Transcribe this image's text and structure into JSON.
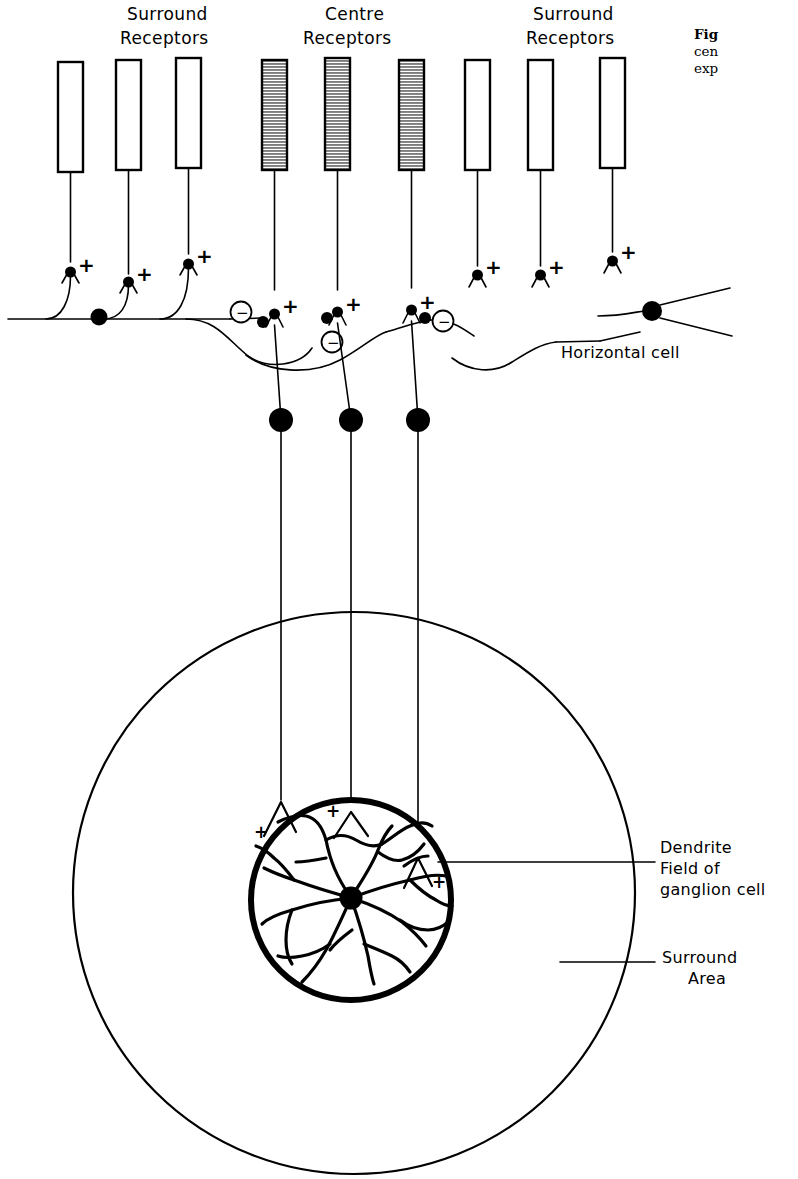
{
  "figure": {
    "domain": "Diagram",
    "background_color": "#ffffff",
    "ink_color": "#000000",
    "centre_bar_fill": "#9a9a9a",
    "surround_bar_fill": "#ffffff",
    "width": 798,
    "height": 1179
  },
  "top_labels": [
    {
      "id": "surround-left",
      "line1": "Surround",
      "line2": "Receptors",
      "x": 127,
      "y": 18
    },
    {
      "id": "centre",
      "line1": "Centre",
      "line2": "Receptors",
      "x": 318,
      "y": 18
    },
    {
      "id": "surround-right",
      "line1": "Surround",
      "line2": "Receptors",
      "x": 530,
      "y": 18
    }
  ],
  "receptors": [
    {
      "id": "surround-receptor-1",
      "group": "surround",
      "x": 58,
      "fill": "#ffffff"
    },
    {
      "id": "surround-receptor-2",
      "group": "surround",
      "x": 116,
      "fill": "#ffffff"
    },
    {
      "id": "surround-receptor-3",
      "group": "surround",
      "x": 176,
      "fill": "#ffffff"
    },
    {
      "id": "centre-receptor-1",
      "group": "centre",
      "x": 262,
      "fill": "#9a9a9a"
    },
    {
      "id": "centre-receptor-2",
      "group": "centre",
      "x": 325,
      "fill": "#9a9a9a"
    },
    {
      "id": "centre-receptor-3",
      "group": "centre",
      "x": 399,
      "fill": "#9a9a9a"
    },
    {
      "id": "surround-receptor-4",
      "group": "surround",
      "x": 465,
      "fill": "#ffffff"
    },
    {
      "id": "surround-receptor-5",
      "group": "surround",
      "x": 528,
      "fill": "#ffffff"
    },
    {
      "id": "surround-receptor-6",
      "group": "surround",
      "x": 600,
      "fill": "#ffffff"
    }
  ],
  "synapse_signs": {
    "excitatory": "+",
    "inhibitory": "−",
    "excitatory_count": 12,
    "inhibitory_count": 3
  },
  "inline_labels": [
    {
      "id": "horizontal-cell-label",
      "text": "Horizontal cell",
      "x": 560,
      "y": 352
    },
    {
      "id": "dendrite-field-label-line1",
      "text": "Dendrite",
      "x": 660,
      "y": 847
    },
    {
      "id": "dendrite-field-label-line2",
      "text": "Field of",
      "x": 660,
      "y": 868
    },
    {
      "id": "dendrite-field-label-line3",
      "text": "ganglion cell",
      "x": 660,
      "y": 889
    },
    {
      "id": "surround-area-label-line1",
      "text": "Surround",
      "x": 663,
      "y": 958
    },
    {
      "id": "surround-area-label-line2",
      "text": "Area",
      "x": 688,
      "y": 979
    }
  ],
  "caption": {
    "lines": [
      {
        "text": "Fig",
        "bold": true
      },
      {
        "text": "cen",
        "bold": false
      },
      {
        "text": "exp",
        "bold": false
      }
    ],
    "note": "caption is clipped at the right page margin"
  },
  "geometry": {
    "bar_top": 58,
    "bar_height": 112,
    "bar_width": 25,
    "horizontal_cell_y": 318,
    "bipolar_soma_y": 420,
    "bipolar_axon_x": [
      281,
      351,
      418
    ],
    "outer_circle": {
      "cx": 354,
      "cy": 893,
      "r": 281
    },
    "inner_circle": {
      "cx": 351,
      "cy": 900,
      "r": 100
    },
    "ganglion_soma": {
      "cx": 351,
      "cy": 898,
      "r": 11
    }
  }
}
